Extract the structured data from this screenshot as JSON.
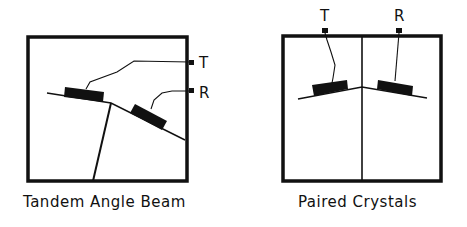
{
  "diagrams": [
    {
      "id": "tandem",
      "caption": "Tandem Angle Beam",
      "labels": {
        "transmitter": "T",
        "receiver": "R"
      }
    },
    {
      "id": "paired",
      "caption": "Paired Crystals",
      "labels": {
        "transmitter": "T",
        "receiver": "R"
      }
    }
  ],
  "colors": {
    "ink": "#111111",
    "background": "#ffffff"
  }
}
